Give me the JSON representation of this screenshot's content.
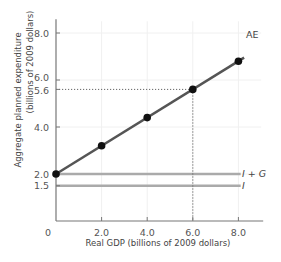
{
  "chart_data": {
    "type": "line",
    "title": "",
    "xlabel": "Real GDP (billions of 2009 dollars)",
    "ylabel_line1": "Aggregate planned expenditure",
    "ylabel_line2": "(billions of 2009 dollars)",
    "xlim": [
      0,
      9
    ],
    "ylim": [
      0,
      8.5
    ],
    "x_ticks": [
      {
        "value": 0,
        "label": "0"
      },
      {
        "value": 2,
        "label": "2.0"
      },
      {
        "value": 4,
        "label": "4.0"
      },
      {
        "value": 6,
        "label": "6.0"
      },
      {
        "value": 8,
        "label": "8.0"
      }
    ],
    "y_ticks": [
      {
        "value": 1.5,
        "label": "1.5"
      },
      {
        "value": 2.0,
        "label": "2.0"
      },
      {
        "value": 4.0,
        "label": "4.0"
      },
      {
        "value": 5.6,
        "label": "5.6"
      },
      {
        "value": 6.0,
        "label": "6.0"
      },
      {
        "value": 8.0,
        "label": "8.0"
      }
    ],
    "grid": true,
    "series": [
      {
        "name": "AE",
        "color": "#555555",
        "markers": true,
        "x": [
          0,
          2,
          4,
          6,
          8
        ],
        "y": [
          2.0,
          3.2,
          4.4,
          5.6,
          6.8
        ]
      },
      {
        "name": "I + G",
        "color": "#aaaaaa",
        "markers": false,
        "x": [
          0,
          8.1
        ],
        "y": [
          2.0,
          2.0
        ]
      },
      {
        "name": "I",
        "color": "#aaaaaa",
        "markers": false,
        "x": [
          0,
          8.1
        ],
        "y": [
          1.5,
          1.5
        ]
      }
    ],
    "annotations": [
      {
        "type": "dotted-guide",
        "x": 6.0,
        "y": 5.6,
        "description": "Dotted lines from point (6.0, 5.6) to both axes"
      }
    ]
  },
  "labels": {
    "ae": "AE",
    "ig_i": "I",
    "ig_plus": " + ",
    "ig_g": "G",
    "i": "I"
  }
}
